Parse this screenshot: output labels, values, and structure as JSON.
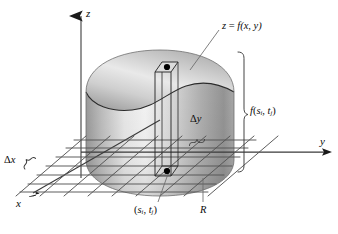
{
  "figure": {
    "type": "math-diagram",
    "background_color": "#ffffff",
    "ink_color": "#1a1a1a"
  },
  "axes": {
    "z": {
      "label": "z",
      "direction": "up",
      "arrow": true
    },
    "y": {
      "label": "y",
      "direction": "right",
      "arrow": true
    },
    "x": {
      "label": "x",
      "direction": "down-left",
      "arrow": true
    }
  },
  "labels": {
    "surface_equation": {
      "text_plain": "z = f(x, y)",
      "lhs": "z",
      "eq": " = ",
      "fn": "f",
      "args": "(x, y)"
    },
    "height": {
      "text_plain": "f(s , t )",
      "fn": "f",
      "open": "(",
      "s": "s",
      "s_sub": "i",
      "comma": ", ",
      "t": "t",
      "t_sub": "j",
      "close": ")"
    },
    "delta_y": {
      "delta": "Δ",
      "var": "y"
    },
    "delta_x": {
      "delta": "Δ",
      "var": "x"
    },
    "sample_point": {
      "open": "(",
      "s": "s",
      "s_sub": "i",
      "comma": ", ",
      "t": "t",
      "t_sub": "j",
      "close": ")"
    },
    "region": {
      "text": "R"
    }
  },
  "solid": {
    "description": "Cylindrical solid under the surface z = f(x, y) above rectangle R",
    "top_surface_shade_light": "#f2f2f2",
    "top_surface_shade_dark": "#b7b7b7",
    "body_shade_light": "#f6f6f6",
    "body_shade_dark": "#8c8c8c"
  },
  "column": {
    "description": "Representative rectangular column of base Δx by Δy and height f(s_i, t_j)",
    "top_dot": true,
    "base_dot": true,
    "dot_color": "#000000"
  },
  "grid": {
    "description": "Rectangular partition of region R in the xy-plane",
    "horizontal_lines": 7,
    "diagonal_lines": 9,
    "line_color": "#4a4a4a"
  },
  "brackets": {
    "height_bracket": "curly brace marking the column height f(s_i, t_j)",
    "delta_y_brace": "curly brace marking Δy width",
    "delta_x_brace": "curly brace marking Δx width"
  }
}
